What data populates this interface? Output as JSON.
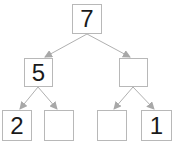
{
  "diagram": {
    "type": "binary-tree",
    "colors": {
      "border": "#b8b8b8",
      "edge": "#a8a8a8",
      "text": "#1a1a1a"
    },
    "nodes": [
      {
        "id": "root",
        "value": "7",
        "x": 72,
        "y": 4,
        "w": 30,
        "h": 30
      },
      {
        "id": "left",
        "value": "5",
        "x": 24,
        "y": 58,
        "w": 29,
        "h": 29
      },
      {
        "id": "right",
        "value": "",
        "x": 119,
        "y": 58,
        "w": 29,
        "h": 29
      },
      {
        "id": "left-left",
        "value": "2",
        "x": 2,
        "y": 110,
        "w": 30,
        "h": 31
      },
      {
        "id": "left-right",
        "value": "",
        "x": 44,
        "y": 110,
        "w": 30,
        "h": 31
      },
      {
        "id": "right-left",
        "value": "",
        "x": 97,
        "y": 110,
        "w": 30,
        "h": 31
      },
      {
        "id": "right-right",
        "value": "1",
        "x": 141,
        "y": 110,
        "w": 31,
        "h": 31
      }
    ],
    "edges": [
      {
        "from": "root",
        "to": "left"
      },
      {
        "from": "root",
        "to": "right"
      },
      {
        "from": "left",
        "to": "left-left"
      },
      {
        "from": "left",
        "to": "left-right"
      },
      {
        "from": "right",
        "to": "right-left"
      },
      {
        "from": "right",
        "to": "right-right"
      }
    ]
  }
}
